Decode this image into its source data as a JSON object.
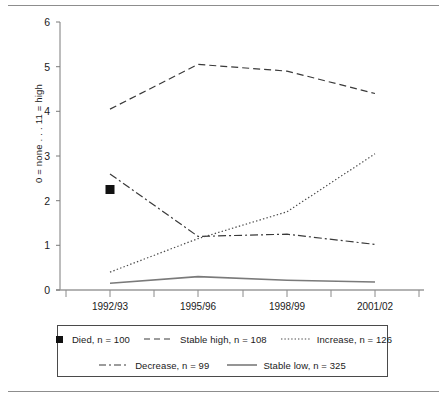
{
  "chart_data": {
    "type": "line",
    "title": "",
    "subtitle": "",
    "xlabel": "",
    "ylabel": "0 = none . . . 11 = high",
    "categories": [
      "1992/93",
      "1995/96",
      "1998/99",
      "2001/02"
    ],
    "ylim": [
      0,
      6
    ],
    "yticks": [
      0,
      1,
      2,
      3,
      4,
      5,
      6
    ],
    "grid": false,
    "legend_position": "bottom",
    "series": [
      {
        "name": "Died, n = 100",
        "label": "Died, n = 100",
        "style": "marker-only",
        "marker": "filled-square",
        "x": [
          "1992/93"
        ],
        "values": [
          2.25
        ]
      },
      {
        "name": "Stable high, n = 108",
        "label": "Stable high, n = 108",
        "style": "dashed",
        "values": [
          4.05,
          5.05,
          4.9,
          4.4
        ]
      },
      {
        "name": "Increase, n = 126",
        "label": "Increase, n = 126",
        "style": "dotted",
        "values": [
          0.4,
          1.15,
          1.75,
          3.05
        ]
      },
      {
        "name": "Decrease, n = 99",
        "label": "Decrease, n = 99",
        "style": "dash-dot",
        "values": [
          2.6,
          1.2,
          1.25,
          1.02
        ]
      },
      {
        "name": "Stable low, n = 325",
        "label": "Stable low, n = 325",
        "style": "solid",
        "values": [
          0.15,
          0.3,
          0.22,
          0.18
        ]
      }
    ],
    "colors": {
      "line": "#3a3a3a",
      "axis": "#7a7a7a",
      "marker": "#111111",
      "text": "#1a1a1a"
    }
  },
  "axis": {
    "y_tick_0": "0",
    "y_tick_1": "1",
    "y_tick_2": "2",
    "y_tick_3": "3",
    "y_tick_4": "4",
    "y_tick_5": "5",
    "y_tick_6": "6",
    "y_title": "0 = none . . . 11 = high",
    "x_tick_0": "1992/93",
    "x_tick_1": "1995/96",
    "x_tick_2": "1998/99",
    "x_tick_3": "2001/02"
  },
  "legend": {
    "row1": [
      {
        "label": "Died, n = 100",
        "style": "filled-square"
      },
      {
        "label": "Stable high, n = 108",
        "style": "dashed"
      },
      {
        "label": "Increase, n = 126",
        "style": "dotted"
      }
    ],
    "row2": [
      {
        "label": "Decrease, n = 99",
        "style": "dash-dot"
      },
      {
        "label": "Stable low, n = 325",
        "style": "solid"
      }
    ]
  }
}
